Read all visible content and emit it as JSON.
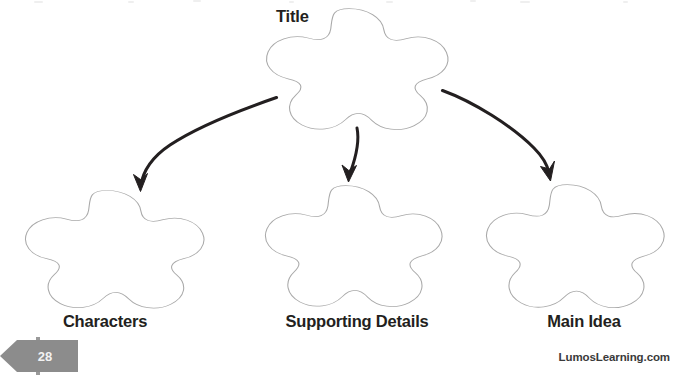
{
  "page": {
    "width": 680,
    "height": 375,
    "background_color": "#ffffff",
    "page_number": "28",
    "badge_color": "#8c8c8c",
    "badge_text_color": "#f2f2f2",
    "footer_brand": "LumosLearning.com",
    "ink_color": "#231f20",
    "shape_outline_color": "#a9a9a9"
  },
  "diagram": {
    "type": "hierarchy-graphic-organizer",
    "shape": "five-lobed-rounded-star",
    "root": {
      "id": "title",
      "label": "Title",
      "label_position": "left-of-shape",
      "center_x": 355,
      "center_y": 69,
      "width": 186,
      "height": 128
    },
    "children": [
      {
        "id": "characters",
        "label": "Characters",
        "label_position": "below-shape",
        "center_x": 113,
        "center_y": 249,
        "width": 183,
        "height": 124
      },
      {
        "id": "supporting-details",
        "label": "Supporting Details",
        "label_position": "below-shape",
        "center_x": 352,
        "center_y": 246,
        "width": 181,
        "height": 128
      },
      {
        "id": "main-idea",
        "label": "Main Idea",
        "label_position": "below-shape",
        "center_x": 574,
        "center_y": 247,
        "width": 182,
        "height": 130
      }
    ],
    "connectors": [
      {
        "id": "arrow-title-to-characters",
        "from": "title",
        "to": "characters",
        "style": "curved-arrow"
      },
      {
        "id": "arrow-title-to-supporting",
        "from": "title",
        "to": "supporting-details",
        "style": "curved-arrow"
      },
      {
        "id": "arrow-title-to-main-idea",
        "from": "title",
        "to": "main-idea",
        "style": "curved-arrow"
      }
    ]
  }
}
